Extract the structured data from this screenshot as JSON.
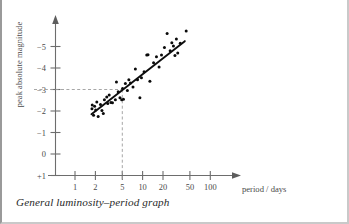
{
  "figure": {
    "caption": "General luminosity–period graph"
  },
  "chart_data": {
    "type": "scatter",
    "title": "",
    "xlabel": "period / days",
    "ylabel": "peak absolute magnitude",
    "x_scale": "log",
    "xlim": [
      0.8,
      160
    ],
    "ylim": [
      1,
      -5.6
    ],
    "grid": false,
    "legend": null,
    "xticks": [
      "1",
      "2",
      "5",
      "10",
      "20",
      "50",
      "100"
    ],
    "xtick_values": [
      1,
      2,
      5,
      10,
      20,
      50,
      100
    ],
    "yticks": [
      "−5",
      "−4",
      "−3",
      "−2",
      "−1",
      "0",
      "+1"
    ],
    "ytick_values": [
      -5,
      -4,
      -3,
      -2,
      -1,
      0,
      1
    ],
    "guide_lines": {
      "note": "dashed construction lines from y = -3 to the curve and down to period = 5 days",
      "x": 5,
      "y": -3
    },
    "trend_line": {
      "label": "best-fit line",
      "points": [
        [
          1.75,
          -1.85
        ],
        [
          42,
          -5.25
        ]
      ]
    },
    "series": [
      {
        "name": "Cepheid variables",
        "points": [
          [
            1.78,
            -2.1
          ],
          [
            1.8,
            -2.28
          ],
          [
            1.88,
            -1.8
          ],
          [
            1.95,
            -2.22
          ],
          [
            2.02,
            -2.05
          ],
          [
            2.1,
            -2.42
          ],
          [
            2.2,
            -1.75
          ],
          [
            2.38,
            -2.3
          ],
          [
            2.5,
            -2.02
          ],
          [
            2.62,
            -1.88
          ],
          [
            2.72,
            -2.52
          ],
          [
            2.95,
            -2.65
          ],
          [
            3.05,
            -2.35
          ],
          [
            3.2,
            -2.75
          ],
          [
            3.4,
            -2.4
          ],
          [
            3.58,
            -2.38
          ],
          [
            3.95,
            -2.52
          ],
          [
            4.1,
            -3.35
          ],
          [
            4.35,
            -2.9
          ],
          [
            4.62,
            -2.62
          ],
          [
            4.9,
            -2.52
          ],
          [
            5.05,
            -3.05
          ],
          [
            5.2,
            -2.55
          ],
          [
            5.55,
            -3.28
          ],
          [
            5.95,
            -2.95
          ],
          [
            6.25,
            -3.45
          ],
          [
            6.6,
            -3.3
          ],
          [
            7.2,
            -3.12
          ],
          [
            7.8,
            -3.95
          ],
          [
            8.4,
            -3.45
          ],
          [
            9.1,
            -2.62
          ],
          [
            9.6,
            -3.55
          ],
          [
            10.5,
            -3.82
          ],
          [
            11.5,
            -4.6
          ],
          [
            12.0,
            -4.62
          ],
          [
            12.8,
            -3.38
          ],
          [
            14.5,
            -4.25
          ],
          [
            16.0,
            -4.52
          ],
          [
            17.5,
            -4.05
          ],
          [
            19.0,
            -4.6
          ],
          [
            21.0,
            -4.95
          ],
          [
            23.0,
            -5.6
          ],
          [
            25.5,
            -4.8
          ],
          [
            27.0,
            -5.18
          ],
          [
            28.5,
            -5.02
          ],
          [
            30.0,
            -4.58
          ],
          [
            31.5,
            -5.35
          ],
          [
            33.0,
            -4.7
          ],
          [
            36.0,
            -5.15
          ],
          [
            44.0,
            -5.72
          ]
        ]
      }
    ]
  }
}
